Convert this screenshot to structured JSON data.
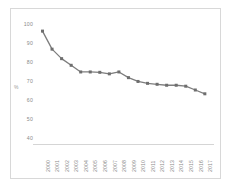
{
  "chart_data": {
    "type": "line",
    "title": "",
    "subtitle": "",
    "xlabel": "",
    "ylabel": "%",
    "ylim": [
      40,
      100
    ],
    "yticks": [
      100,
      90,
      80,
      70,
      60,
      50,
      40
    ],
    "grid": false,
    "legend": null,
    "marker": "square",
    "line_color": "#7d7d7d",
    "marker_color": "#6e6e6e",
    "categories": [
      "2000",
      "2001",
      "2002",
      "2003",
      "2004",
      "2005",
      "2006",
      "2007",
      "2008",
      "2009",
      "2010",
      "2011",
      "2012",
      "2013",
      "2014",
      "2015",
      "2016",
      "2017"
    ],
    "values": [
      96.0,
      86.5,
      81.5,
      78.0,
      74.5,
      74.5,
      74.3,
      73.5,
      74.5,
      71.5,
      69.5,
      68.5,
      68.0,
      67.5,
      67.5,
      67.0,
      65.0,
      63.0
    ]
  }
}
